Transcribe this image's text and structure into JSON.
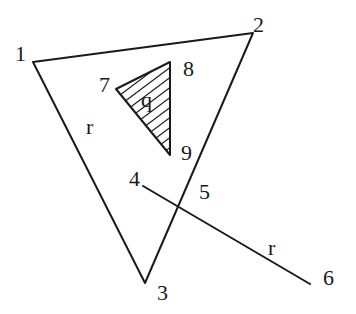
{
  "diagram": {
    "type": "geometry-figure",
    "outer_triangle": {
      "vertices": [
        {
          "id": "1",
          "label": "1",
          "x": 33,
          "y": 62
        },
        {
          "id": "2",
          "label": "2",
          "x": 253,
          "y": 33
        },
        {
          "id": "3",
          "label": "3",
          "x": 145,
          "y": 283
        }
      ],
      "region_label": "r"
    },
    "inner_triangle": {
      "vertices": [
        {
          "id": "7",
          "label": "7",
          "x": 116,
          "y": 89
        },
        {
          "id": "8",
          "label": "8",
          "x": 170,
          "y": 62
        },
        {
          "id": "9",
          "label": "9",
          "x": 170,
          "y": 155
        }
      ],
      "region_label": "q",
      "fill": "hatched"
    },
    "segment": {
      "start": {
        "id": "4",
        "label": "4",
        "x": 143,
        "y": 186
      },
      "crossing": {
        "id": "5",
        "label": "5"
      },
      "end": {
        "id": "6",
        "label": "6",
        "x": 310,
        "y": 284
      },
      "label": "r"
    },
    "colors": {
      "stroke": "#1a1a1a",
      "background": "#ffffff"
    }
  }
}
